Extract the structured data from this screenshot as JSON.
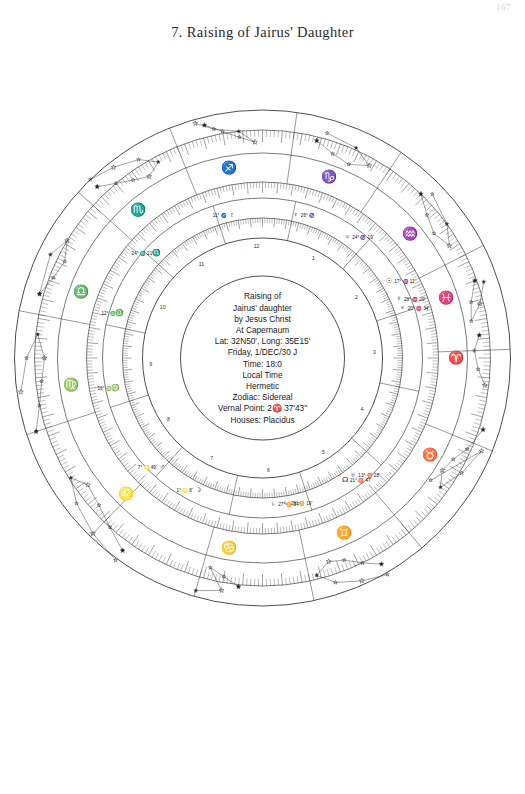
{
  "page": {
    "number": "167",
    "chapter_title": "7. Raising of Jairus' Daughter"
  },
  "chart_data": {
    "type": "scatter",
    "subtitle": "Sidereal zodiac horoscope wheel with constellation star figures",
    "grid": true,
    "legend_position": "center",
    "xlabel": "",
    "ylabel": "",
    "center_block": {
      "lines": [
        "Raising of",
        "Jairus' daughter",
        "by Jesus Christ",
        "At Capernaum",
        "Lat: 32N50', Long: 35E15'",
        "Friday, 1/DEC/30 J",
        "Time: 18:0",
        "Local Time",
        "Hermetic",
        "Zodiac: Sidereal",
        "Vernal Point: 2♈ 37'43\"",
        "Houses: Placidus"
      ],
      "event": "Raising of Jairus' daughter",
      "agent": "by Jesus Christ",
      "place": "At Capernaum",
      "latitude": "32N50'",
      "longitude": "35E15'",
      "date": "Friday, 1/DEC/30 J",
      "time": "18:0",
      "time_zone": "Local Time",
      "system": "Hermetic",
      "zodiac": "Sidereal",
      "vernal_point": "2♈ 37'43\"",
      "houses": "Placidus"
    },
    "house_numbers": [
      "1",
      "2",
      "3",
      "4",
      "5",
      "6",
      "7",
      "8",
      "9",
      "10",
      "11",
      "12"
    ],
    "zodiac_signs": [
      {
        "name": "Aries",
        "glyph": "♈",
        "angle_deg": 90
      },
      {
        "name": "Taurus",
        "glyph": "♉",
        "angle_deg": 120
      },
      {
        "name": "Gemini",
        "glyph": "♊",
        "angle_deg": 155
      },
      {
        "name": "Cancer",
        "glyph": "♋",
        "angle_deg": 190
      },
      {
        "name": "Leo",
        "glyph": "♌",
        "angle_deg": 225
      },
      {
        "name": "Virgo",
        "glyph": "♍",
        "angle_deg": 262
      },
      {
        "name": "Libra",
        "glyph": "♎",
        "angle_deg": 290
      },
      {
        "name": "Scorpio",
        "glyph": "♏",
        "angle_deg": 320
      },
      {
        "name": "Sagittarius",
        "glyph": "♐",
        "angle_deg": 350
      },
      {
        "name": "Capricorn",
        "glyph": "♑",
        "angle_deg": 20
      },
      {
        "name": "Aquarius",
        "glyph": "♒",
        "angle_deg": 50
      },
      {
        "name": "Pisces",
        "glyph": "♓",
        "angle_deg": 72
      }
    ],
    "planet_positions": [
      {
        "body": "Node",
        "glyph": "☊",
        "text": "21° ♉ 47'",
        "angle_deg": 147
      },
      {
        "body": "Uranus",
        "glyph": "♅",
        "text": "13° ♉ 28'",
        "angle_deg": 143
      },
      {
        "body": "Saturn",
        "glyph": "♄",
        "text": "28° ♊ 19'",
        "angle_deg": 172
      },
      {
        "body": "Saturn2",
        "glyph": "♄",
        "text": "27° ♊ 34'",
        "angle_deg": 177
      },
      {
        "body": "Moon",
        "glyph": "☽",
        "text": "1° ♌ 8'",
        "angle_deg": 205
      },
      {
        "body": "Mars",
        "glyph": "♂",
        "text": "7° ♌ 49'",
        "angle_deg": 222
      },
      {
        "body": "Virgo-pt",
        "glyph": "♍",
        "text": "16° ♍",
        "angle_deg": 258
      },
      {
        "body": "Libra-pt",
        "glyph": "♎",
        "text": "12° ♎",
        "angle_deg": 288
      },
      {
        "body": "Scorpio-pt",
        "glyph": "♏",
        "text": "24° ♏ 21'",
        "angle_deg": 316
      },
      {
        "body": "Pluto",
        "glyph": "♇",
        "text": "11° ♐",
        "angle_deg": 349
      },
      {
        "body": "Venus",
        "glyph": "♀",
        "text": "26° ♑",
        "angle_deg": 12
      },
      {
        "body": "Jupiter",
        "glyph": "♃",
        "text": "24° ♑ 19'",
        "angle_deg": 34
      },
      {
        "body": "Sun",
        "glyph": "☉",
        "text": "17° ♒ 11'",
        "angle_deg": 58
      },
      {
        "body": "Mercury",
        "glyph": "☿",
        "text": "28° ♓ 20'",
        "angle_deg": 66
      },
      {
        "body": "Neptune",
        "glyph": "♆",
        "text": "20° ♓ 34'",
        "angle_deg": 70
      }
    ],
    "rings": [
      {
        "name": "outer-constellation-boundary",
        "radius": 248
      },
      {
        "name": "outer-degree-scale",
        "radius": 228
      },
      {
        "name": "constellation-field",
        "radius": 205
      },
      {
        "name": "mid-degree-scale",
        "radius": 176
      },
      {
        "name": "sign-band-outer",
        "radius": 160
      },
      {
        "name": "sign-band-inner",
        "radius": 140
      },
      {
        "name": "house-cusp-ring",
        "radius": 120
      },
      {
        "name": "center-text-circle",
        "radius": 82
      }
    ]
  }
}
